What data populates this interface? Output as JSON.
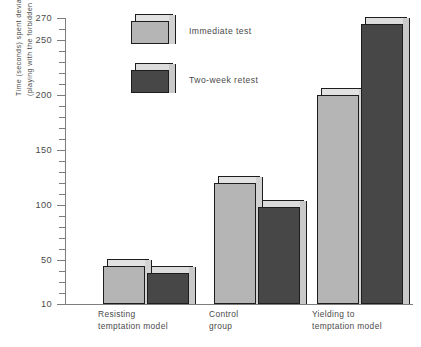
{
  "chart_data": {
    "type": "bar",
    "title": "",
    "xlabel": "",
    "ylabel": "Time (seconds) spent deviating (playing with the forbidden toy)",
    "ylabel_lines": [
      "Time (seconds) spent deviating",
      "(playing with the forbidden toy)"
    ],
    "categories": [
      "Resisting temptation model",
      "Control group",
      "Yielding to temptation model"
    ],
    "category_lines": [
      [
        "Resisting",
        "temptation model"
      ],
      [
        "Control",
        "group"
      ],
      [
        "Yielding to",
        "temptation model"
      ]
    ],
    "series": [
      {
        "name": "Immediate test",
        "values": [
          45,
          120,
          200
        ],
        "color": "#b5b5b5"
      },
      {
        "name": "Two-week retest",
        "values": [
          38,
          98,
          265
        ],
        "color": "#474747"
      }
    ],
    "ylim": [
      10,
      270
    ],
    "yticks_major": [
      10,
      50,
      100,
      150,
      200,
      250,
      270
    ],
    "ytick_labels": [
      "10",
      "50",
      "100",
      "150",
      "200",
      "250",
      "270"
    ],
    "ytick_minor_step": 10,
    "grid": false,
    "legend_position": "top-left-inside"
  },
  "legend": {
    "items": [
      {
        "label": "Immediate test",
        "swatch": "light-bar-swatch"
      },
      {
        "label": "Two-week retest",
        "swatch": "dark-bar-swatch"
      }
    ]
  },
  "colors": {
    "bar_light_face": "#b5b5b5",
    "bar_light_top": "#e2e2e2",
    "bar_light_side": "#d2d2d2",
    "bar_dark_face": "#474747",
    "bar_dark_top": "#dcdcdc",
    "bar_dark_side": "#c9c9c9",
    "outline": "#1d1d1d",
    "axis": "#7d7d7d",
    "text": "#4a4a4a",
    "background": "#ffffff"
  }
}
